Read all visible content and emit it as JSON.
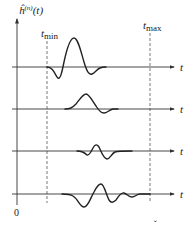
{
  "diagram": {
    "y_axis_label": "ĥ",
    "y_axis_label_sup": "(n)",
    "y_axis_label_arg": "(t)",
    "t_min_label": "t",
    "t_min_sub": "min",
    "t_max_label": "t",
    "t_max_sub": "max",
    "time_axis_label": "t",
    "origin_label": "0",
    "footer_mark": "ˇ",
    "rows": [
      {
        "index": 1,
        "axis_label": "t",
        "description": "wavelet starting just after t_min, negative dip then large positive peak, small negative lobe"
      },
      {
        "index": 2,
        "axis_label": "t",
        "description": "positive bump followed by small negative lobe"
      },
      {
        "index": 3,
        "axis_label": "t",
        "description": "small oscillating wavelet, centered"
      },
      {
        "index": 4,
        "axis_label": "t",
        "description": "oscillating wavelet with decaying tail reaching t_max"
      }
    ]
  }
}
